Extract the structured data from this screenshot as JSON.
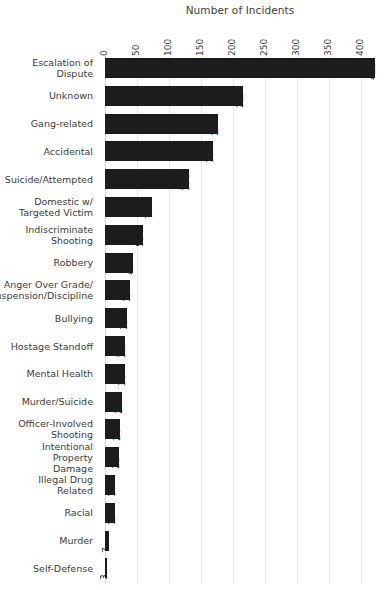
{
  "chart_data": {
    "type": "bar",
    "orientation": "horizontal",
    "title": "Number of Incidents",
    "xlabel": "",
    "ylabel": "",
    "xlim": [
      0,
      422
    ],
    "axis_position": "top",
    "grid": true,
    "legend": "none",
    "bar_color": "#1c1c1c",
    "text_color": "#3c3c3c",
    "grid_color": "#e9e9e9",
    "tick_labels": [
      "0",
      "50",
      "100",
      "150",
      "200",
      "250",
      "300",
      "350",
      "400"
    ],
    "ticks": [
      0,
      50,
      100,
      150,
      200,
      250,
      300,
      350,
      400
    ],
    "categories": [
      "Escalation of Dispute",
      "Unknown",
      "Gang-related",
      "Accidental",
      "Suicide/Attempted",
      "Domestic w/\nTargeted Victim",
      "Indiscriminate\nShooting",
      "Robbery",
      "Anger Over Grade/\nSuspension/Discipline",
      "Bullying",
      "Hostage Standoff",
      "Mental Health",
      "Murder/Suicide",
      "Officer-Involved\nShooting",
      "Intentional Property\nDamage",
      "Illegal Drug Related",
      "Racial",
      "Murder",
      "Self-Defense"
    ],
    "values": [
      422,
      215,
      177,
      169,
      132,
      74,
      59,
      44,
      39,
      35,
      31,
      31,
      26,
      24,
      22,
      16,
      15,
      7,
      3
    ],
    "value_labels": [
      "422",
      "215",
      "177",
      "169",
      "132",
      "74",
      "59",
      "44",
      "39",
      "35",
      "31",
      "31",
      "26",
      "24",
      "22",
      "16",
      "15",
      "7",
      "3"
    ]
  }
}
